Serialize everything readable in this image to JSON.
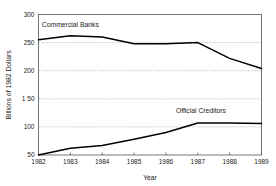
{
  "chart_data": {
    "type": "line",
    "title": "",
    "xlabel": "Year",
    "ylabel": "Billions of 1982 Dollars",
    "x": [
      1982,
      1983,
      1984,
      1985,
      1986,
      1987,
      1988,
      1989
    ],
    "xticklabels": [
      "1982",
      "1983",
      "1984",
      "1985",
      "1986",
      "1987",
      "1988",
      "1989"
    ],
    "yticks": [
      50,
      100,
      150,
      200,
      250,
      300
    ],
    "yticklabels": [
      "50",
      "100",
      "1 50",
      "200",
      "250",
      "300"
    ],
    "ylim": [
      50,
      300
    ],
    "xlim": [
      1982,
      1989
    ],
    "grid": "horizontal-dotted",
    "legend_position": "inline-annotations",
    "series": [
      {
        "name": "Commercial Banks",
        "values": [
          255,
          262,
          260,
          248,
          248,
          250,
          222,
          204
        ],
        "color": "#000000",
        "label_x": 1983.0,
        "label_y": 277
      },
      {
        "name": "Official Creditors",
        "values": [
          50,
          62,
          67,
          78,
          90,
          107,
          107,
          106
        ],
        "color": "#000000",
        "label_x": 1987.1,
        "label_y": 125
      }
    ]
  },
  "axis": {
    "x_title": "Year",
    "y_title": "Billions of 1982 Dollars"
  }
}
